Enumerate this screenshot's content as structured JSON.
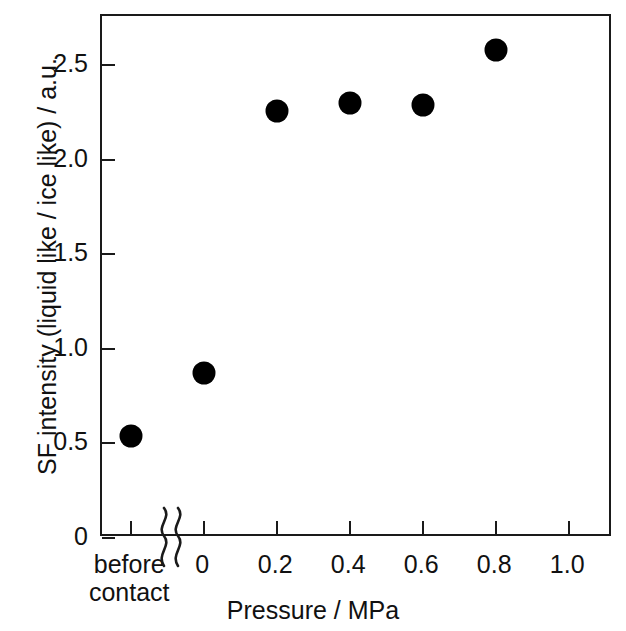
{
  "chart_data": {
    "type": "scatter",
    "title": "",
    "xlabel": "Pressure / MPa",
    "ylabel": "SF intensity (liquid like / ice like) / a.u.",
    "xlim": [
      -0.28,
      1.12
    ],
    "ylim": [
      0,
      2.76
    ],
    "grid": false,
    "legend": null,
    "x_break_after_category": "before contact",
    "categories": [
      "before contact",
      "0",
      "0.2",
      "0.4",
      "0.6",
      "0.8"
    ],
    "x": [
      -0.2,
      0.0,
      0.2,
      0.4,
      0.6,
      0.8
    ],
    "values": [
      0.54,
      0.87,
      2.26,
      2.3,
      2.29,
      2.58
    ],
    "points": [
      {
        "x_label": "before contact",
        "x": -0.2,
        "y": 0.54
      },
      {
        "x_label": "0",
        "x": 0.0,
        "y": 0.87
      },
      {
        "x_label": "0.2",
        "x": 0.2,
        "y": 2.26
      },
      {
        "x_label": "0.4",
        "x": 0.4,
        "y": 2.3
      },
      {
        "x_label": "0.6",
        "x": 0.6,
        "y": 2.29
      },
      {
        "x_label": "0.8",
        "x": 0.8,
        "y": 2.58
      }
    ],
    "marker": {
      "shape": "circle",
      "color": "#000000",
      "size_px": 23
    },
    "xticks": [
      {
        "value": -0.2,
        "label": "before",
        "label2": "contact"
      },
      {
        "value": 0.0,
        "label": "0"
      },
      {
        "value": 0.2,
        "label": "0.2"
      },
      {
        "value": 0.4,
        "label": "0.4"
      },
      {
        "value": 0.6,
        "label": "0.6"
      },
      {
        "value": 0.8,
        "label": "0.8"
      },
      {
        "value": 1.0,
        "label": "1.0"
      }
    ],
    "yticks": [
      {
        "value": 0,
        "label": "0"
      },
      {
        "value": 0.5,
        "label": "0.5"
      },
      {
        "value": 1.0,
        "label": "1.0"
      },
      {
        "value": 1.5,
        "label": "1.5"
      },
      {
        "value": 2.0,
        "label": "2.0"
      },
      {
        "value": 2.5,
        "label": "2.5"
      }
    ],
    "axis_color": "#1a1a1a"
  }
}
